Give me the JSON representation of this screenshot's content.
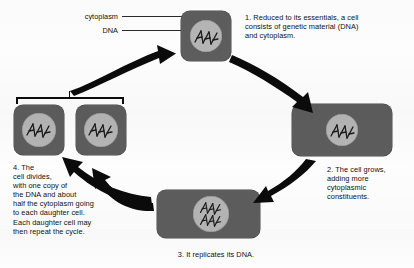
{
  "diagram": {
    "background_color": "#fdfdfd",
    "cell_body_color": "#5d5d5d",
    "nucleus_color": "#b5b5b5",
    "ink_color": "#0b0b0b"
  },
  "callouts": {
    "cytoplasm_label": "cytoplasm",
    "dna_label": "DNA"
  },
  "steps": [
    {
      "number": "1.",
      "text": "1.  Reduced to its essentials, a cell consists of genetic material (DNA) and cytoplasm.",
      "lines": [
        "1.  Reduced to its essentials, a cell",
        "consists of genetic material (DNA)",
        "and cytoplasm."
      ]
    },
    {
      "number": "2.",
      "text": "2. The cell grows, adding more cytoplasmic constituents.",
      "lines": [
        "2. The cell grows,",
        "adding more",
        "cytoplasmic",
        "constituents."
      ]
    },
    {
      "number": "3.",
      "text": "3.  It replicates its DNA.",
      "lines": [
        "3.  It replicates its DNA."
      ]
    },
    {
      "number": "4.",
      "text": "4.  The cell divides, with one copy of the DNA and about half the cytoplasm going to each daughter cell. Each daughter cell may then repeat the cycle.",
      "lines": [
        "4.  The",
        "cell divides,",
        "with one copy of",
        "the DNA and about",
        "half the cytoplasm going",
        "to each daughter cell.",
        "Each daughter cell may",
        "then repeat the cycle."
      ]
    }
  ],
  "cells": [
    {
      "id": "cell-1-essentials",
      "dna_strands": 1
    },
    {
      "id": "cell-2-grown",
      "dna_strands": 1
    },
    {
      "id": "cell-3-replicated",
      "dna_strands": 2
    },
    {
      "id": "cell-4-daughter-left",
      "dna_strands": 1
    },
    {
      "id": "cell-4-daughter-right",
      "dna_strands": 1
    }
  ]
}
